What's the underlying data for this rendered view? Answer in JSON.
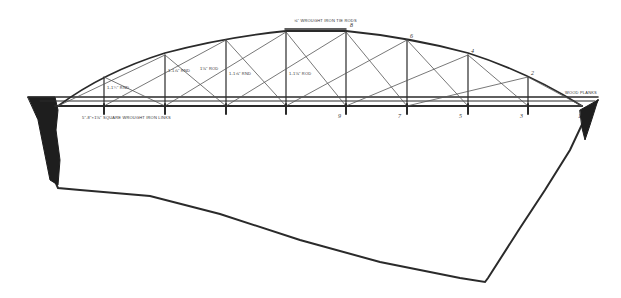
{
  "diagram": {
    "annotations": {
      "tie_rods": "⅝\" WROUGHT IRON TIE RODS",
      "diag_left": "1-1¾\" RND",
      "vert_1": "1-1⅞\" RND",
      "diag_2": "1⅛\" ROD",
      "vert_2": "1-1⅝\" RND",
      "center": "1-1⅛\" ROD",
      "wood_planks": "WOOD PLANKS",
      "floor_beam": "5\"-8\"×1⅛\" SQUARE WROUGHT IRON LINKS"
    },
    "top_nodes": [
      "8",
      "6",
      "4",
      "2"
    ],
    "bottom_nodes": [
      "9",
      "7",
      "5",
      "3",
      "1"
    ],
    "colors": {
      "ink": "#2a2a2a",
      "paper": "#ffffff"
    }
  }
}
